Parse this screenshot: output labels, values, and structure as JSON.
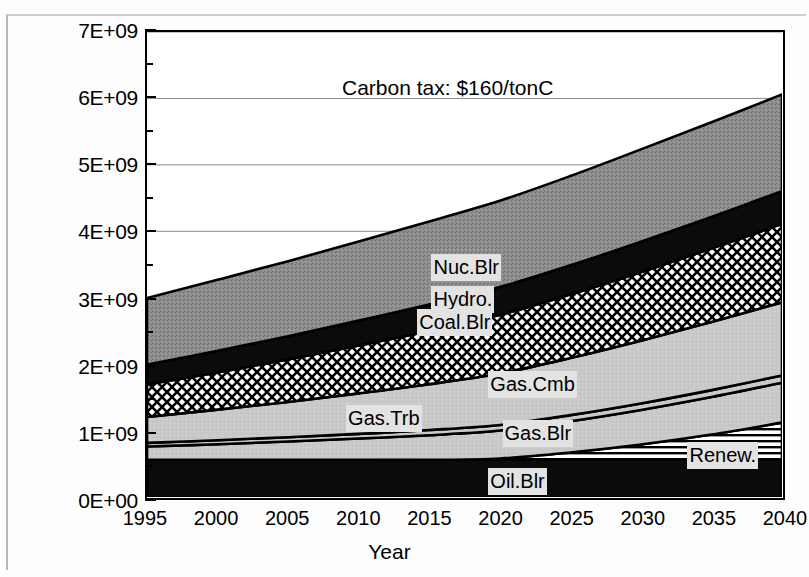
{
  "chart_data": {
    "type": "area",
    "title": "",
    "annotation": "Carbon tax:  $160/tonC",
    "xlabel": "Year",
    "ylabel": "",
    "x": [
      1995,
      2000,
      2005,
      2010,
      2015,
      2020,
      2025,
      2030,
      2035,
      2040
    ],
    "xlim": [
      1995,
      2040
    ],
    "ylim": [
      0,
      7000000000
    ],
    "xticks": [
      "1995",
      "2000",
      "2005",
      "2010",
      "2015",
      "2020",
      "2025",
      "2030",
      "2035",
      "2040"
    ],
    "yticks": [
      "0E+00",
      "1E+09",
      "2E+09",
      "3E+09",
      "4E+09",
      "5E+09",
      "6E+09",
      "7E+09"
    ],
    "ytick_values": [
      0,
      1000000000,
      2000000000,
      3000000000,
      4000000000,
      5000000000,
      6000000000,
      7000000000
    ],
    "y_minor_ticks": [
      500000000,
      1500000000,
      2500000000,
      3500000000,
      4500000000,
      5500000000,
      6500000000
    ],
    "grid": "horizontal-major",
    "stacked": true,
    "legend_position": "inline-labels",
    "series": [
      {
        "name": "Oil.Blr",
        "fill": "solid-black",
        "color": "#0b0b0b",
        "values": [
          560000000,
          560000000,
          560000000,
          560000000,
          560000000,
          560000000,
          560000000,
          560000000,
          560000000,
          560000000
        ]
      },
      {
        "name": "Renew.",
        "fill": "horizontal-lines",
        "color": "#ffffff",
        "values": [
          0,
          0,
          0,
          0,
          0,
          20000000,
          110000000,
          230000000,
          380000000,
          560000000
        ]
      },
      {
        "name": "Gas.Blr",
        "fill": "light-gray",
        "color": "#c9c9c9",
        "values": [
          200000000,
          235000000,
          275000000,
          320000000,
          370000000,
          420000000,
          470000000,
          520000000,
          565000000,
          600000000
        ]
      },
      {
        "name": "Gas.Trb",
        "fill": "light-gray-thin",
        "color": "#c9c9c9",
        "values": [
          55000000,
          60000000,
          65000000,
          70000000,
          78000000,
          85000000,
          92000000,
          98000000,
          104000000,
          110000000
        ]
      },
      {
        "name": "Gas.Cmb",
        "fill": "light-gray-band",
        "color": "#c9c9c9",
        "values": [
          390000000,
          460000000,
          530000000,
          610000000,
          690000000,
          775000000,
          860000000,
          945000000,
          1025000000,
          1100000000
        ]
      },
      {
        "name": "Coal.Blr",
        "fill": "diagonal-crosshatch",
        "color": "#ffffff",
        "values": [
          490000000,
          560000000,
          640000000,
          720000000,
          800000000,
          880000000,
          955000000,
          1030000000,
          1105000000,
          1180000000
        ]
      },
      {
        "name": "Hydro.",
        "fill": "solid-black",
        "color": "#0b0b0b",
        "values": [
          300000000,
          325000000,
          350000000,
          375000000,
          400000000,
          420000000,
          440000000,
          460000000,
          478000000,
          495000000
        ]
      },
      {
        "name": "Nuc.Blr",
        "fill": "medium-gray-grain",
        "color": "#8f8f8f",
        "values": [
          1000000000,
          1070000000,
          1130000000,
          1190000000,
          1250000000,
          1300000000,
          1345000000,
          1390000000,
          1425000000,
          1455000000
        ]
      }
    ],
    "stack_totals": [
      2995000000,
      3270000000,
      3550000000,
      3845000000,
      4148000000,
      4460000000,
      4782000000,
      5103000000,
      5402000000,
      5660000000
    ],
    "series_labels": [
      {
        "text": "Nuc.Blr",
        "x": 2015,
        "y": 3500000000
      },
      {
        "text": "Hydro.",
        "x": 2015,
        "y": 3030000000
      },
      {
        "text": "Coal.Blr",
        "x": 2014,
        "y": 2680000000
      },
      {
        "text": "Gas.Cmb",
        "x": 2019,
        "y": 1760000000
      },
      {
        "text": "Gas.Trb",
        "x": 2009,
        "y": 1250000000
      },
      {
        "text": "Gas.Blr",
        "x": 2020,
        "y": 1030000000
      },
      {
        "text": "Oil.Blr",
        "x": 2019,
        "y": 310000000
      },
      {
        "text": "Renew.",
        "x": 2033,
        "y": 700000000
      }
    ]
  }
}
